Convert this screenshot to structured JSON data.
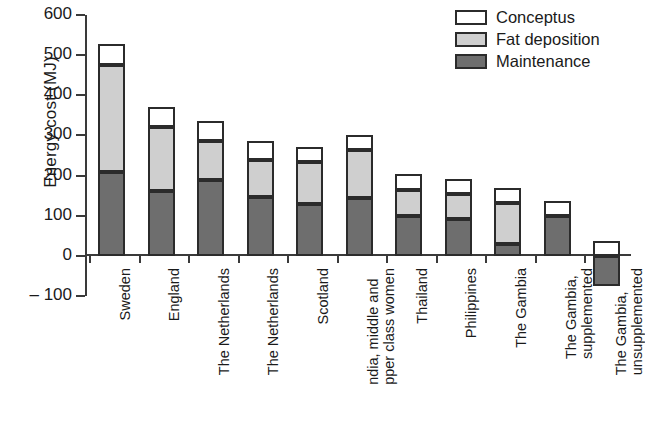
{
  "chart_data": {
    "type": "bar",
    "subtype": "stacked-bar",
    "title": "",
    "xlabel": "",
    "ylabel": "Energy cost (MJ)",
    "ylim": [
      -100,
      600
    ],
    "ytick_step": 100,
    "yticks": [
      600,
      500,
      400,
      300,
      200,
      100,
      0,
      -100
    ],
    "ytick_labels": [
      "600",
      "500",
      "400",
      "300",
      "200",
      "100",
      "0",
      "– 100"
    ],
    "grid": false,
    "legend_position": "top-right",
    "legend": [
      "Conceptus",
      "Fat deposition",
      "Maintenance"
    ],
    "colors": {
      "conceptus": "#ffffff",
      "fat_deposition": "#cfcfcf",
      "maintenance": "#6e6e6e",
      "outline": "#2b2b2b",
      "axis": "#3a3a3a"
    },
    "categories": [
      "Sweden",
      "England",
      "The Netherlands",
      "The Netherlands",
      "Scotland",
      "India, middle and upper class women",
      "Thailand",
      "Philippines",
      "The Gambia",
      "The Gambia, supplemented",
      "The Gambia, unsupplemented"
    ],
    "series": [
      {
        "name": "Maintenance",
        "values": [
          210,
          162,
          190,
          147,
          128,
          143,
          100,
          93,
          30,
          100,
          -75
        ]
      },
      {
        "name": "Fat deposition",
        "values": [
          265,
          158,
          97,
          91,
          105,
          120,
          65,
          60,
          102,
          0,
          0
        ]
      },
      {
        "name": "Conceptus",
        "values": [
          52,
          52,
          50,
          49,
          39,
          39,
          40,
          38,
          36,
          37,
          38
        ]
      }
    ],
    "totals": [
      527,
      372,
      337,
      287,
      272,
      302,
      205,
      191,
      168,
      137,
      38
    ]
  },
  "axis": {
    "y_title": "Energy cost (MJ)",
    "ticks": [
      {
        "value": 600,
        "label": "600"
      },
      {
        "value": 500,
        "label": "500"
      },
      {
        "value": 400,
        "label": "400"
      },
      {
        "value": 300,
        "label": "300"
      },
      {
        "value": 200,
        "label": "200"
      },
      {
        "value": 100,
        "label": "100"
      },
      {
        "value": 0,
        "label": "0"
      },
      {
        "value": -100,
        "label": "– 100"
      }
    ]
  },
  "legend": {
    "items": [
      {
        "label": "Conceptus",
        "swatch": "conceptus"
      },
      {
        "label": "Fat deposition",
        "swatch": "fat"
      },
      {
        "label": "Maintenance",
        "swatch": "maintenance"
      }
    ]
  },
  "x_labels": [
    {
      "line1": "Sweden",
      "line2": ""
    },
    {
      "line1": "England",
      "line2": ""
    },
    {
      "line1": "The Netherlands",
      "line2": ""
    },
    {
      "line1": "The Netherlands",
      "line2": ""
    },
    {
      "line1": "Scotland",
      "line2": ""
    },
    {
      "line1": "ndia, middle and",
      "line2": "pper class women"
    },
    {
      "line1": "Thailand",
      "line2": ""
    },
    {
      "line1": "Philippines",
      "line2": ""
    },
    {
      "line1": "The Gambia",
      "line2": ""
    },
    {
      "line1": "The Gambia,",
      "line2": "supplemented"
    },
    {
      "line1": "The Gambia,",
      "line2": "unsupplemented"
    }
  ]
}
